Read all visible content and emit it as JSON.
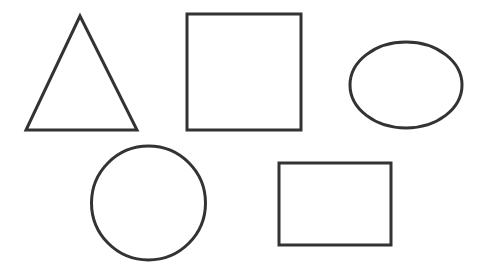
{
  "canvas": {
    "width": 481,
    "height": 276,
    "background": "#ffffff"
  },
  "style": {
    "stroke": "#333333",
    "stroke_width": 3,
    "fill": "none"
  },
  "shapes": [
    {
      "type": "triangle",
      "label": "Triangle",
      "points": [
        [
          80,
          16
        ],
        [
          26,
          130
        ],
        [
          137,
          130
        ]
      ]
    },
    {
      "type": "square",
      "label": "Square",
      "x": 187,
      "y": 14,
      "width": 114,
      "height": 116
    },
    {
      "type": "ellipse",
      "label": "Oval",
      "cx": 406,
      "cy": 85,
      "rx": 56,
      "ry": 43
    },
    {
      "type": "circle",
      "label": "Circle",
      "cx": 148.5,
      "cy": 203,
      "r": 57
    },
    {
      "type": "rectangle",
      "label": "Rectangle",
      "x": 279,
      "y": 163,
      "width": 112,
      "height": 82
    }
  ]
}
